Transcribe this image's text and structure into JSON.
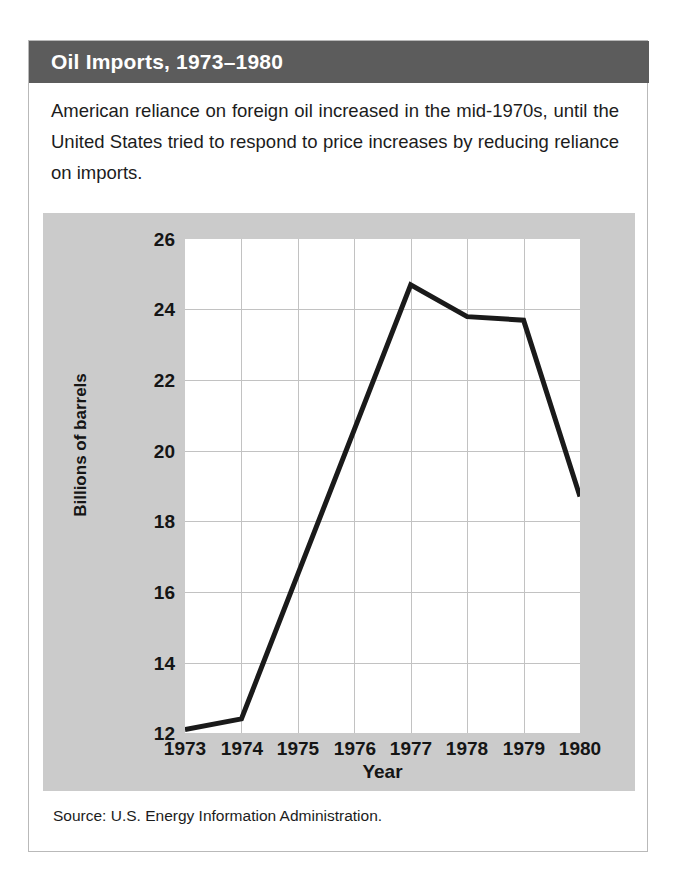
{
  "figure": {
    "title": "Oil Imports, 1973–1980",
    "caption": "American reliance on foreign oil increased in the mid-1970s, until the United States tried to respond to price increases by reducing reliance on imports.",
    "source": "Source: U.S. Energy Information Administration.",
    "colors": {
      "title_bar": "#5c5c5c",
      "title_text": "#ffffff",
      "panel_background": "#cbcbcb",
      "plot_background": "#ffffff",
      "gridline": "#c2c2c2",
      "line_series": "#1a1a1a"
    }
  },
  "chart_data": {
    "type": "line",
    "title": "Oil Imports, 1973–1980",
    "xlabel": "Year",
    "ylabel": "Billions of barrels",
    "x": [
      1973,
      1974,
      1975,
      1976,
      1977,
      1978,
      1979,
      1980
    ],
    "categories": [
      "1973",
      "1974",
      "1975",
      "1976",
      "1977",
      "1978",
      "1979",
      "1980"
    ],
    "values": [
      12.1,
      12.4,
      16.5,
      20.6,
      24.7,
      23.8,
      23.7,
      18.7
    ],
    "series": [
      {
        "name": "Oil imports",
        "values": [
          12.1,
          12.4,
          16.5,
          20.6,
          24.7,
          23.8,
          23.7,
          18.7
        ]
      }
    ],
    "xlim": [
      1973,
      1980
    ],
    "ylim": [
      12,
      26
    ],
    "yticks": [
      12,
      14,
      16,
      18,
      20,
      22,
      24,
      26
    ],
    "xticks": [
      "1973",
      "1974",
      "1975",
      "1976",
      "1977",
      "1978",
      "1979",
      "1980"
    ],
    "grid": true,
    "legend": false,
    "line_width": 5
  }
}
